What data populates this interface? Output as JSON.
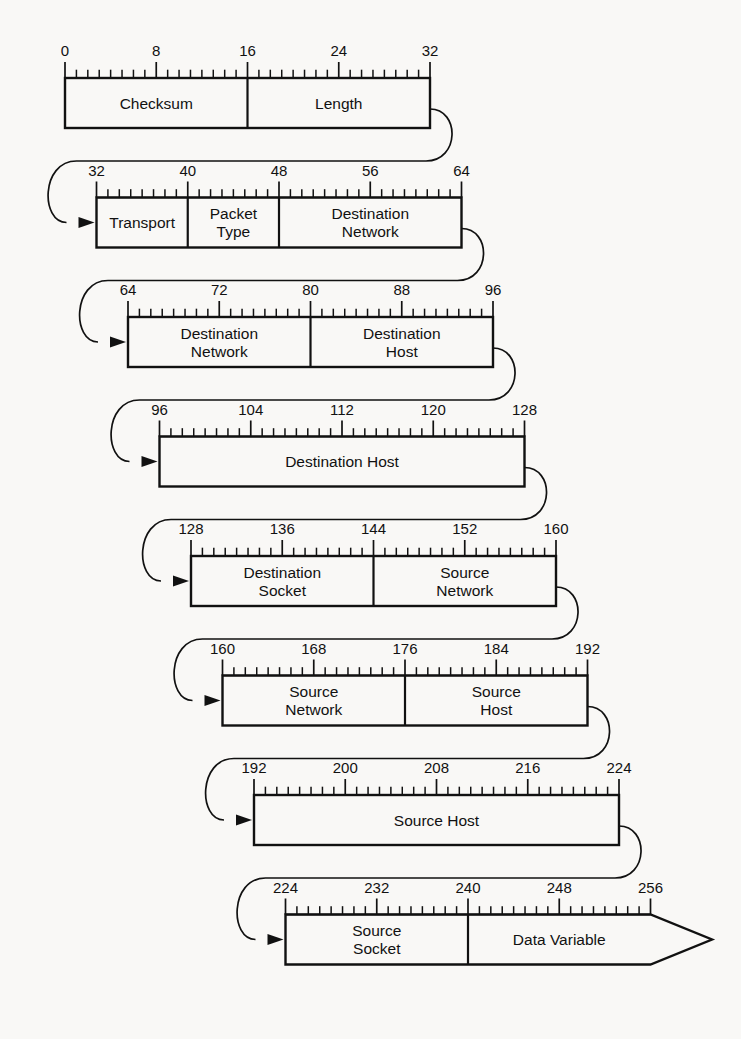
{
  "diagram": {
    "type": "packet-format",
    "bit_width_per_row": 32,
    "total_bits": 256,
    "colors": {
      "background": "#f9f8f6",
      "line": "#111111",
      "text": "#111111"
    },
    "rows": [
      {
        "id": "row-1",
        "bit_start": 0,
        "bit_end": 32,
        "tick_labels": [
          "0",
          "8",
          "16",
          "24",
          "32"
        ],
        "tick_label_bits": [
          0,
          8,
          16,
          24,
          32
        ],
        "fields": [
          {
            "label": "Checksum",
            "bit_start": 0,
            "bit_end": 16,
            "lines": [
              "Checksum"
            ]
          },
          {
            "label": "Length",
            "bit_start": 16,
            "bit_end": 32,
            "lines": [
              "Length"
            ]
          }
        ],
        "has_inbound_arrow": false,
        "has_outbound_connector": true,
        "has_terminal_arrow": false
      },
      {
        "id": "row-2",
        "bit_start": 32,
        "bit_end": 64,
        "tick_labels": [
          "32",
          "40",
          "48",
          "56",
          "64"
        ],
        "tick_label_bits": [
          32,
          40,
          48,
          56,
          64
        ],
        "fields": [
          {
            "label": "Transport",
            "bit_start": 32,
            "bit_end": 40,
            "lines": [
              "Transport"
            ]
          },
          {
            "label": "Packet Type",
            "bit_start": 40,
            "bit_end": 48,
            "lines": [
              "Packet",
              "Type"
            ]
          },
          {
            "label": "Destination Network",
            "bit_start": 48,
            "bit_end": 64,
            "lines": [
              "Destination",
              "Network"
            ]
          }
        ],
        "has_inbound_arrow": true,
        "has_outbound_connector": true,
        "has_terminal_arrow": false
      },
      {
        "id": "row-3",
        "bit_start": 64,
        "bit_end": 96,
        "tick_labels": [
          "64",
          "72",
          "80",
          "88",
          "96"
        ],
        "tick_label_bits": [
          64,
          72,
          80,
          88,
          96
        ],
        "fields": [
          {
            "label": "Destination Network",
            "bit_start": 64,
            "bit_end": 80,
            "lines": [
              "Destination",
              "Network"
            ]
          },
          {
            "label": "Destination Host",
            "bit_start": 80,
            "bit_end": 96,
            "lines": [
              "Destination",
              "Host"
            ]
          }
        ],
        "has_inbound_arrow": true,
        "has_outbound_connector": true,
        "has_terminal_arrow": false
      },
      {
        "id": "row-4",
        "bit_start": 96,
        "bit_end": 128,
        "tick_labels": [
          "96",
          "104",
          "112",
          "120",
          "128"
        ],
        "tick_label_bits": [
          96,
          104,
          112,
          120,
          128
        ],
        "fields": [
          {
            "label": "Destination Host",
            "bit_start": 96,
            "bit_end": 128,
            "lines": [
              "Destination Host"
            ]
          }
        ],
        "has_inbound_arrow": true,
        "has_outbound_connector": true,
        "has_terminal_arrow": false
      },
      {
        "id": "row-5",
        "bit_start": 128,
        "bit_end": 160,
        "tick_labels": [
          "128",
          "136",
          "144",
          "152",
          "160"
        ],
        "tick_label_bits": [
          128,
          136,
          144,
          152,
          160
        ],
        "fields": [
          {
            "label": "Destination Socket",
            "bit_start": 128,
            "bit_end": 144,
            "lines": [
              "Destination",
              "Socket"
            ]
          },
          {
            "label": "Source Network",
            "bit_start": 144,
            "bit_end": 160,
            "lines": [
              "Source",
              "Network"
            ]
          }
        ],
        "has_inbound_arrow": true,
        "has_outbound_connector": true,
        "has_terminal_arrow": false
      },
      {
        "id": "row-6",
        "bit_start": 160,
        "bit_end": 192,
        "tick_labels": [
          "160",
          "168",
          "176",
          "184",
          "192"
        ],
        "tick_label_bits": [
          160,
          168,
          176,
          184,
          192
        ],
        "fields": [
          {
            "label": "Source Network",
            "bit_start": 160,
            "bit_end": 176,
            "lines": [
              "Source",
              "Network"
            ]
          },
          {
            "label": "Source Host",
            "bit_start": 176,
            "bit_end": 192,
            "lines": [
              "Source",
              "Host"
            ]
          }
        ],
        "has_inbound_arrow": true,
        "has_outbound_connector": true,
        "has_terminal_arrow": false
      },
      {
        "id": "row-7",
        "bit_start": 192,
        "bit_end": 224,
        "tick_labels": [
          "192",
          "200",
          "208",
          "216",
          "224"
        ],
        "tick_label_bits": [
          192,
          200,
          208,
          216,
          224
        ],
        "fields": [
          {
            "label": "Source Host",
            "bit_start": 192,
            "bit_end": 224,
            "lines": [
              "Source Host"
            ]
          }
        ],
        "has_inbound_arrow": true,
        "has_outbound_connector": true,
        "has_terminal_arrow": false
      },
      {
        "id": "row-8",
        "bit_start": 224,
        "bit_end": 256,
        "tick_labels": [
          "224",
          "232",
          "240",
          "248",
          "256"
        ],
        "tick_label_bits": [
          224,
          232,
          240,
          248,
          256
        ],
        "fields": [
          {
            "label": "Source Socket",
            "bit_start": 224,
            "bit_end": 240,
            "lines": [
              "Source",
              "Socket"
            ]
          },
          {
            "label": "Data Variable",
            "bit_start": 240,
            "bit_end": 256,
            "lines": [
              "Data Variable"
            ]
          }
        ],
        "has_inbound_arrow": true,
        "has_outbound_connector": false,
        "has_terminal_arrow": true
      }
    ]
  },
  "geometry": {
    "row_left_start": 65,
    "row_width": 365,
    "row_x_step": 31.5,
    "row_top_start": 78,
    "row_y_step": 119.5,
    "box_height": 50,
    "ruler_height": 16,
    "label_offset_above_ruler": 6,
    "terminal_arrow_tip_x": 712,
    "terminal_arrow_half_height": 25
  }
}
